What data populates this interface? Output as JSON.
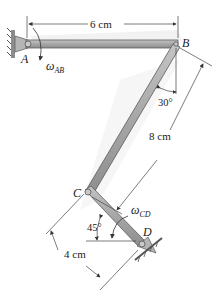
{
  "figure": {
    "type": "four-bar linkage",
    "points": {
      "A": {
        "label": "A"
      },
      "B": {
        "label": "B"
      },
      "C": {
        "label": "C"
      },
      "D": {
        "label": "D"
      }
    },
    "dimensions": {
      "ab_length": "6 cm",
      "bc_length": "8 cm",
      "cd_length": "4 cm",
      "angle_b": "30°",
      "angle_cd": "45°"
    },
    "angular_velocities": {
      "ab": {
        "symbol": "ω",
        "subscript": "AB"
      },
      "cd": {
        "symbol": "ω",
        "subscript": "CD"
      }
    },
    "colors": {
      "link_fill": "#a9a9a9",
      "link_edge": "#5a5a5a",
      "dim_line": "#444444",
      "support": "#8c8c8c",
      "shadow": "#e6e6e6"
    }
  }
}
